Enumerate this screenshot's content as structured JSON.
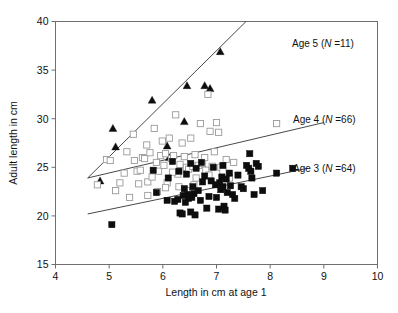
{
  "chart_data": {
    "type": "scatter",
    "title": "",
    "xlabel": "Length in cm at age 1",
    "ylabel": "Adult length in cm",
    "xlim": [
      4,
      10
    ],
    "ylim": [
      15,
      40
    ],
    "xticks": [
      4,
      5,
      6,
      7,
      8,
      9,
      10
    ],
    "yticks": [
      15,
      20,
      25,
      30,
      35,
      40
    ],
    "xtick_labels": [
      "4",
      "5",
      "6",
      "7",
      "8",
      "9",
      "10"
    ],
    "ytick_labels": [
      "15",
      "20",
      "25",
      "30",
      "35",
      "40"
    ],
    "grid": false,
    "legend_position": "inline-right-of-lines",
    "series": [
      {
        "name": "Age 5",
        "n": 11,
        "label": "Age 5 (",
        "label_italic": "N",
        "label_tail": " =11)",
        "marker": "filled-triangle",
        "color": "#0d0d0d",
        "points": [
          [
            4.83,
            23.6
          ],
          [
            5.07,
            29.0
          ],
          [
            5.12,
            27.1
          ],
          [
            5.8,
            31.9
          ],
          [
            6.08,
            27.2
          ],
          [
            6.12,
            26.0
          ],
          [
            6.4,
            29.7
          ],
          [
            6.45,
            33.4
          ],
          [
            6.78,
            33.4
          ],
          [
            6.88,
            33.1
          ],
          [
            7.07,
            36.9
          ]
        ],
        "fit_line": {
          "x": [
            4.6,
            7.55
          ],
          "y": [
            23.9,
            40.0
          ]
        }
      },
      {
        "name": "Age 4",
        "n": 66,
        "label": "Age 4 (",
        "label_italic": "N",
        "label_tail": " =66)",
        "marker": "open-square",
        "color": "#9a9a9a",
        "points": [
          [
            4.78,
            23.2
          ],
          [
            4.95,
            25.8
          ],
          [
            5.02,
            25.7
          ],
          [
            5.12,
            22.6
          ],
          [
            5.2,
            23.4
          ],
          [
            5.28,
            24.4
          ],
          [
            5.33,
            26.6
          ],
          [
            5.38,
            21.9
          ],
          [
            5.45,
            28.4
          ],
          [
            5.47,
            25.7
          ],
          [
            5.52,
            24.6
          ],
          [
            5.55,
            23.3
          ],
          [
            5.58,
            24.7
          ],
          [
            5.62,
            26.0
          ],
          [
            5.66,
            25.9
          ],
          [
            5.7,
            27.3
          ],
          [
            5.72,
            23.5
          ],
          [
            5.76,
            26.5
          ],
          [
            5.8,
            24.0
          ],
          [
            5.84,
            29.0
          ],
          [
            5.88,
            25.5
          ],
          [
            5.92,
            24.6
          ],
          [
            5.96,
            26.2
          ],
          [
            5.99,
            27.7
          ],
          [
            6.02,
            25.2
          ],
          [
            6.05,
            26.4
          ],
          [
            6.08,
            23.4
          ],
          [
            6.12,
            28.0
          ],
          [
            6.16,
            25.9
          ],
          [
            6.2,
            26.2
          ],
          [
            6.24,
            30.4
          ],
          [
            6.28,
            24.3
          ],
          [
            6.32,
            25.3
          ],
          [
            6.36,
            27.5
          ],
          [
            6.4,
            26.1
          ],
          [
            6.44,
            25.0
          ],
          [
            6.48,
            24.8
          ],
          [
            6.52,
            28.0
          ],
          [
            6.56,
            25.1
          ],
          [
            6.6,
            26.3
          ],
          [
            6.62,
            23.9
          ],
          [
            6.66,
            25.2
          ],
          [
            6.7,
            29.5
          ],
          [
            6.74,
            25.4
          ],
          [
            6.78,
            26.0
          ],
          [
            6.8,
            24.7
          ],
          [
            6.84,
            32.5
          ],
          [
            6.88,
            28.7
          ],
          [
            6.92,
            25.1
          ],
          [
            6.96,
            26.6
          ],
          [
            7.0,
            29.6
          ],
          [
            7.04,
            28.6
          ],
          [
            7.08,
            25.0
          ],
          [
            7.12,
            24.6
          ],
          [
            7.18,
            25.8
          ],
          [
            7.24,
            23.9
          ],
          [
            6.18,
            24.5
          ],
          [
            6.3,
            23.0
          ],
          [
            6.44,
            22.6
          ],
          [
            5.9,
            22.5
          ],
          [
            5.72,
            22.1
          ],
          [
            6.05,
            22.9
          ],
          [
            6.58,
            23.2
          ],
          [
            6.86,
            24.2
          ],
          [
            7.32,
            25.5
          ],
          [
            8.12,
            29.5
          ]
        ],
        "fit_line": {
          "x": [
            4.6,
            9.0
          ],
          "y": [
            23.9,
            29.6
          ]
        }
      },
      {
        "name": "Age 3",
        "n": 64,
        "label": "Age 3 (",
        "label_italic": "N",
        "label_tail": " =64)",
        "marker": "filled-square",
        "color": "#0d0d0d",
        "points": [
          [
            5.05,
            19.1
          ],
          [
            5.82,
            24.7
          ],
          [
            5.88,
            22.4
          ],
          [
            6.1,
            23.9
          ],
          [
            6.22,
            21.5
          ],
          [
            6.28,
            21.7
          ],
          [
            6.32,
            20.3
          ],
          [
            6.36,
            20.2
          ],
          [
            6.38,
            22.1
          ],
          [
            6.4,
            22.8
          ],
          [
            6.42,
            21.4
          ],
          [
            6.44,
            24.3
          ],
          [
            6.46,
            22.2
          ],
          [
            6.48,
            21.8
          ],
          [
            6.5,
            22.0
          ],
          [
            6.52,
            20.4
          ],
          [
            6.54,
            21.9
          ],
          [
            6.56,
            23.0
          ],
          [
            6.58,
            22.3
          ],
          [
            6.6,
            20.1
          ],
          [
            6.62,
            24.9
          ],
          [
            6.66,
            22.6
          ],
          [
            6.7,
            21.6
          ],
          [
            6.74,
            23.5
          ],
          [
            6.78,
            24.1
          ],
          [
            6.82,
            20.8
          ],
          [
            6.86,
            22.0
          ],
          [
            6.9,
            23.6
          ],
          [
            6.94,
            25.0
          ],
          [
            6.98,
            23.2
          ],
          [
            7.0,
            21.9
          ],
          [
            7.04,
            20.7
          ],
          [
            7.06,
            23.4
          ],
          [
            7.08,
            22.7
          ],
          [
            7.1,
            24.0
          ],
          [
            7.12,
            23.0
          ],
          [
            7.14,
            21.0
          ],
          [
            7.16,
            20.6
          ],
          [
            7.18,
            23.8
          ],
          [
            7.2,
            22.4
          ],
          [
            7.24,
            24.4
          ],
          [
            7.26,
            23.1
          ],
          [
            7.3,
            22.2
          ],
          [
            7.34,
            21.8
          ],
          [
            7.4,
            24.2
          ],
          [
            7.46,
            23.0
          ],
          [
            7.5,
            22.8
          ],
          [
            7.56,
            25.2
          ],
          [
            7.6,
            24.9
          ],
          [
            7.62,
            26.4
          ],
          [
            7.64,
            24.6
          ],
          [
            7.66,
            23.9
          ],
          [
            7.7,
            22.2
          ],
          [
            7.74,
            25.4
          ],
          [
            7.78,
            25.1
          ],
          [
            7.86,
            22.6
          ],
          [
            6.18,
            25.6
          ],
          [
            6.3,
            24.6
          ],
          [
            6.52,
            25.4
          ],
          [
            6.72,
            25.5
          ],
          [
            7.12,
            25.2
          ],
          [
            8.12,
            24.4
          ],
          [
            8.42,
            24.9
          ],
          [
            6.08,
            21.6
          ]
        ],
        "fit_line": {
          "x": [
            4.6,
            8.7
          ],
          "y": [
            20.2,
            24.9
          ]
        }
      }
    ],
    "annotations": [
      {
        "series": "Age 5",
        "x_px": 292,
        "y_px": 47
      },
      {
        "series": "Age 4",
        "x_px": 293,
        "y_px": 123
      },
      {
        "series": "Age 3",
        "x_px": 293,
        "y_px": 172
      }
    ]
  }
}
